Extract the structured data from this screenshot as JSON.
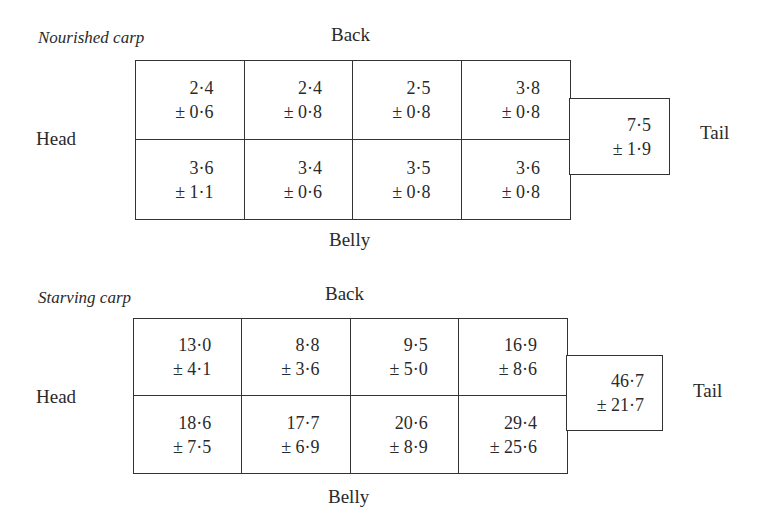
{
  "panels": [
    {
      "title": "Nourished carp",
      "back_label": "Back",
      "belly_label": "Belly",
      "head_label": "Head",
      "tail_label": "Tail",
      "back_row": [
        {
          "mean": "2·4",
          "sd": "± 0·6"
        },
        {
          "mean": "2·4",
          "sd": "± 0·8"
        },
        {
          "mean": "2·5",
          "sd": "± 0·8"
        },
        {
          "mean": "3·8",
          "sd": "± 0·8"
        }
      ],
      "belly_row": [
        {
          "mean": "3·6",
          "sd": "± 1·1"
        },
        {
          "mean": "3·4",
          "sd": "± 0·6"
        },
        {
          "mean": "3·5",
          "sd": "± 0·8"
        },
        {
          "mean": "3·6",
          "sd": "± 0·8"
        }
      ],
      "tail": {
        "mean": "7·5",
        "sd": "± 1·9"
      }
    },
    {
      "title": "Starving carp",
      "back_label": "Back",
      "belly_label": "Belly",
      "head_label": "Head",
      "tail_label": "Tail",
      "back_row": [
        {
          "mean": "13·0",
          "sd": "± 4·1"
        },
        {
          "mean": "8·8",
          "sd": "± 3·6"
        },
        {
          "mean": "9·5",
          "sd": "± 5·0"
        },
        {
          "mean": "16·9",
          "sd": "± 8·6"
        }
      ],
      "belly_row": [
        {
          "mean": "18·6",
          "sd": "± 7·5"
        },
        {
          "mean": "17·7",
          "sd": "± 6·9"
        },
        {
          "mean": "20·6",
          "sd": "± 8·9"
        },
        {
          "mean": "29·4",
          "sd": "± 25·6"
        }
      ],
      "tail": {
        "mean": "46·7",
        "sd": "± 21·7"
      }
    }
  ]
}
